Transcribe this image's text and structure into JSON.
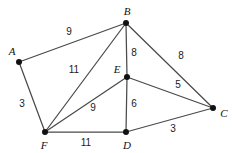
{
  "diagram": {
    "type": "weighted-undirected-graph",
    "width": 237,
    "height": 153,
    "background_color": "#ffffff",
    "edge_color": "#4a4a4a",
    "vertex_color": "#111111",
    "label_color": "#111111"
  },
  "chart_data": {
    "type": "diagram",
    "nodes": [
      {
        "id": "A",
        "label": "A",
        "x": 19,
        "y": 62,
        "label_x": 12,
        "label_y": 51
      },
      {
        "id": "B",
        "label": "B",
        "x": 126,
        "y": 23,
        "label_x": 127,
        "label_y": 11
      },
      {
        "id": "C",
        "label": "C",
        "x": 213,
        "y": 108,
        "label_x": 224,
        "label_y": 113
      },
      {
        "id": "D",
        "label": "D",
        "x": 126,
        "y": 132,
        "label_x": 127,
        "label_y": 145
      },
      {
        "id": "E",
        "label": "E",
        "x": 127,
        "y": 77,
        "label_x": 117,
        "label_y": 69
      },
      {
        "id": "F",
        "label": "F",
        "x": 45,
        "y": 132,
        "label_x": 44,
        "label_y": 145
      }
    ],
    "edges": [
      {
        "source": "A",
        "target": "B",
        "weight": 9,
        "label": "9",
        "label_x": 69,
        "label_y": 32
      },
      {
        "source": "A",
        "target": "F",
        "weight": 3,
        "label": "3",
        "label_x": 22,
        "label_y": 104
      },
      {
        "source": "B",
        "target": "F",
        "weight": 11,
        "label": "11",
        "label_x": 74,
        "label_y": 70
      },
      {
        "source": "B",
        "target": "E",
        "weight": 8,
        "label": "8",
        "label_x": 134,
        "label_y": 53
      },
      {
        "source": "B",
        "target": "C",
        "weight": 8,
        "label": "8",
        "label_x": 181,
        "label_y": 56
      },
      {
        "source": "E",
        "target": "F",
        "weight": 9,
        "label": "9",
        "label_x": 93,
        "label_y": 108
      },
      {
        "source": "E",
        "target": "D",
        "weight": 6,
        "label": "6",
        "label_x": 134,
        "label_y": 104
      },
      {
        "source": "E",
        "target": "C",
        "weight": 5,
        "label": "5",
        "label_x": 178,
        "label_y": 85
      },
      {
        "source": "F",
        "target": "D",
        "weight": 11,
        "label": "11",
        "label_x": 86,
        "label_y": 143
      },
      {
        "source": "C",
        "target": "D",
        "weight": 3,
        "label": "3",
        "label_x": 173,
        "label_y": 129
      }
    ]
  }
}
